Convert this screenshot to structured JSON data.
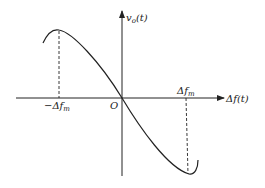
{
  "figure": {
    "type": "discriminator characteristic curve (S-curve)",
    "y_axis_label": "v",
    "y_axis_label_sub": "o",
    "y_axis_label_arg": "(t)",
    "x_axis_label": "Δf",
    "x_axis_label_arg": "(t)",
    "origin_label": "O",
    "tick_neg_label": "−Δf",
    "tick_neg_sub": "m",
    "tick_pos_label": "Δf",
    "tick_pos_sub": "m",
    "colors": {
      "stroke": "#222222",
      "background": "#ffffff"
    }
  }
}
